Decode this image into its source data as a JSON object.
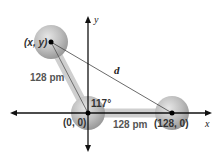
{
  "diagram": {
    "axes": {
      "x_label": "x",
      "y_label": "y"
    },
    "points": [
      {
        "name": "top-atom",
        "label": "(x, y)"
      },
      {
        "name": "origin-atom",
        "label": "(0, 0)"
      },
      {
        "name": "right-atom",
        "label": "(128, 0)"
      }
    ],
    "bond_left_label": "128 pm",
    "bond_bottom_label": "128 pm",
    "angle_label": "117°",
    "distance_label": "d",
    "colors": {
      "sphere": "#b8b8b8",
      "bond": "#c8c8c8",
      "axis": "#111111"
    }
  }
}
